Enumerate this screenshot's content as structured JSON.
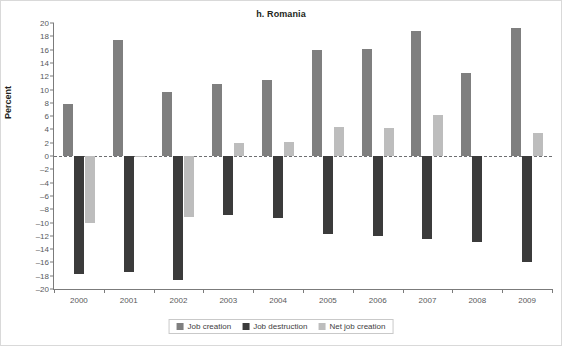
{
  "chart_data": {
    "type": "bar",
    "title": "h. Romania",
    "xlabel": "",
    "ylabel": "Percent",
    "ylim": [
      -20,
      20
    ],
    "ytick_step": 2,
    "yticks": [
      20,
      18,
      16,
      14,
      12,
      10,
      8,
      6,
      4,
      2,
      0,
      -2,
      -4,
      -6,
      -8,
      -10,
      -12,
      -14,
      -16,
      -18,
      -20
    ],
    "ytick_labels": [
      "20",
      "18",
      "16",
      "14",
      "12",
      "10",
      "8",
      "6",
      "4",
      "2",
      "0",
      "–2",
      "–4",
      "–6",
      "–8",
      "–10",
      "–12",
      "–14",
      "–16",
      "–18",
      "–20"
    ],
    "grid": false,
    "zero_line": true,
    "legend_position": "bottom",
    "categories": [
      "2000",
      "2001",
      "2002",
      "2003",
      "2004",
      "2005",
      "2006",
      "2007",
      "2008",
      "2009"
    ],
    "series": [
      {
        "name": "Job creation",
        "color": "#7f7f7f",
        "values": [
          7.8,
          17.5,
          9.6,
          10.9,
          11.5,
          16.0,
          16.1,
          18.8,
          12.5,
          19.3
        ]
      },
      {
        "name": "Job destruction",
        "color": "#3b3b3b",
        "values": [
          -17.8,
          -17.5,
          -18.6,
          -8.9,
          -9.3,
          -11.7,
          -12.0,
          -12.5,
          -13.0,
          -16.0
        ]
      },
      {
        "name": "Net job creation",
        "color": "#bdbdbd",
        "values": [
          -10.0,
          -0.1,
          -9.2,
          1.9,
          2.1,
          4.4,
          4.2,
          6.2,
          0.0,
          3.4
        ]
      }
    ]
  },
  "legend": {
    "items": [
      {
        "label": "Job creation",
        "color": "#7f7f7f"
      },
      {
        "label": "Job destruction",
        "color": "#3b3b3b"
      },
      {
        "label": "Net job creation",
        "color": "#bdbdbd"
      }
    ]
  }
}
